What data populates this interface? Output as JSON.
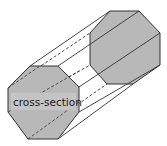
{
  "diagram": {
    "label": "cross-section",
    "colors": {
      "face_fill": "#b8b8b8",
      "label_bg": "#c4c4c4",
      "edge": "#333333",
      "background": "#ffffff"
    }
  }
}
